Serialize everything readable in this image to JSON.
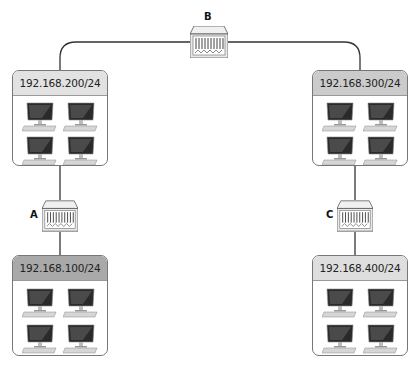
{
  "diagram": {
    "switches": [
      {
        "id": "A",
        "label": "A"
      },
      {
        "id": "B",
        "label": "B"
      },
      {
        "id": "C",
        "label": "C"
      }
    ],
    "networks": [
      {
        "id": "net200",
        "subnet": "192.168.200/24",
        "header_color": "#e2e2e2",
        "hosts": 4
      },
      {
        "id": "net300",
        "subnet": "192.168.300/24",
        "header_color": "#cbcbcb",
        "hosts": 4
      },
      {
        "id": "net100",
        "subnet": "192.168.100/24",
        "header_color": "#a9a9a9",
        "hosts": 4
      },
      {
        "id": "net400",
        "subnet": "192.168.400/24",
        "header_color": "#dedede",
        "hosts": 4
      }
    ],
    "links": [
      [
        "net200",
        "B"
      ],
      [
        "B",
        "net300"
      ],
      [
        "net200",
        "A"
      ],
      [
        "A",
        "net100"
      ],
      [
        "net300",
        "C"
      ],
      [
        "C",
        "net400"
      ]
    ],
    "icons": {
      "host": "desktop-computer-icon",
      "switch": "network-switch-icon"
    }
  }
}
